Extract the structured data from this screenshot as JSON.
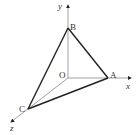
{
  "diagram": {
    "type": "3d-coordinate-tetrahedron",
    "axes": {
      "x": {
        "label": "x"
      },
      "y": {
        "label": "y"
      },
      "z": {
        "label": "z"
      }
    },
    "points": {
      "O": {
        "label": "O"
      },
      "A": {
        "label": "A"
      },
      "B": {
        "label": "B"
      },
      "C": {
        "label": "C"
      }
    },
    "edges": [
      "AB",
      "BC",
      "CA"
    ],
    "axis_segments": [
      "OA",
      "OB",
      "OC"
    ],
    "colors": {
      "axis": "#888888",
      "edge": "#222222",
      "text": "#333333"
    }
  }
}
